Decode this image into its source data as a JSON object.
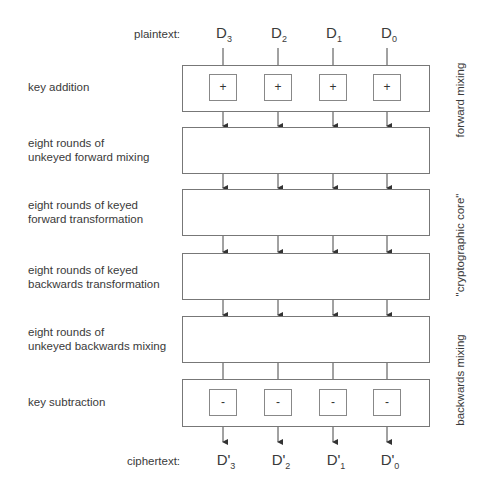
{
  "plaintext": {
    "label": "plaintext:",
    "words": [
      {
        "base": "D",
        "sub": "3"
      },
      {
        "base": "D",
        "sub": "2"
      },
      {
        "base": "D",
        "sub": "1"
      },
      {
        "base": "D",
        "sub": "0"
      }
    ]
  },
  "ciphertext": {
    "label": "ciphertext:",
    "words": [
      {
        "base": "D'",
        "sub": "3"
      },
      {
        "base": "D'",
        "sub": "2"
      },
      {
        "base": "D'",
        "sub": "1"
      },
      {
        "base": "D'",
        "sub": "0"
      }
    ]
  },
  "stages": [
    {
      "label": "key addition",
      "op": "+"
    },
    {
      "label_line1": "eight rounds of",
      "label_line2": "unkeyed forward mixing"
    },
    {
      "label_line1": "eight rounds of keyed",
      "label_line2": "forward transformation"
    },
    {
      "label_line1": "eight rounds of keyed",
      "label_line2": "backwards transformation"
    },
    {
      "label_line1": "eight rounds of",
      "label_line2": "unkeyed backwards mixing"
    },
    {
      "label": "key subtraction",
      "op": "-"
    }
  ],
  "side_labels": {
    "forward": "forward mixing",
    "core": "\"cryptographic core\"",
    "backward": "backwards mixing"
  }
}
